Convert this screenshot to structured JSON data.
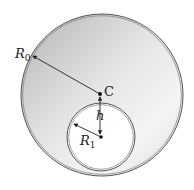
{
  "figure": {
    "labels": {
      "outer_radius": "R",
      "outer_radius_sub": "0",
      "inner_radius": "R",
      "inner_radius_sub": "1",
      "center": "C",
      "offset": "h"
    },
    "geometry": {
      "outer_circle": {
        "cx": 102,
        "cy": 95,
        "r": 81
      },
      "inner_circle": {
        "cx": 101,
        "cy": 137,
        "r": 34
      },
      "center_point": {
        "x": 100,
        "y": 94
      }
    },
    "colors": {
      "shade_dark": "#b8b8b8",
      "shade_light": "#f4f4f4",
      "outline": "#555555",
      "arrow": "#222222"
    }
  }
}
